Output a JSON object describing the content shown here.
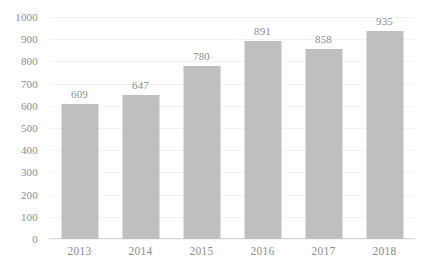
{
  "chart_data": {
    "type": "bar",
    "title": "",
    "subtitle": "",
    "xlabel": "",
    "ylabel": "",
    "categories": [
      "2013",
      "2014",
      "2015",
      "2016",
      "2017",
      "2018"
    ],
    "values": [
      609,
      647,
      780,
      891,
      858,
      935
    ],
    "series": [
      {
        "name": "",
        "values": [
          609,
          647,
          780,
          891,
          858,
          935
        ]
      }
    ],
    "ylim": [
      0,
      1000
    ],
    "y_ticks": [
      0,
      100,
      200,
      300,
      400,
      500,
      600,
      700,
      800,
      900,
      1000
    ],
    "y_tick_labels": [
      "0",
      "100",
      "200",
      "300",
      "400",
      "500",
      "600",
      "700",
      "800",
      "900",
      "1000"
    ],
    "data_labels": [
      "609",
      "647",
      "780",
      "891",
      "858",
      "935"
    ],
    "grid": true,
    "grid_axis": "y",
    "legend": false,
    "legend_position": "none",
    "colors": {
      "bar": "#bfbfbf",
      "text": "#8c8c8c",
      "gridline": "#f2f2f2",
      "axis": "#d9d9d9",
      "background": "#ffffff"
    }
  }
}
